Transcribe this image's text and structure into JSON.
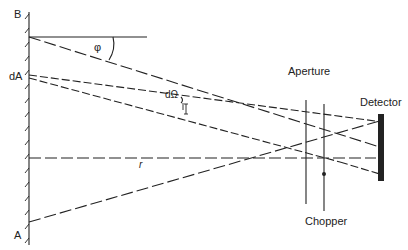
{
  "labels": {
    "B": "B",
    "A": "A",
    "dA": "dA",
    "phi": "φ",
    "dOmega": "dΩ",
    "r": "r",
    "aperture": "Aperture",
    "chopper": "Chopper",
    "detector": "Detector"
  },
  "colors": {
    "ink": "#222222",
    "background": "#ffffff"
  }
}
